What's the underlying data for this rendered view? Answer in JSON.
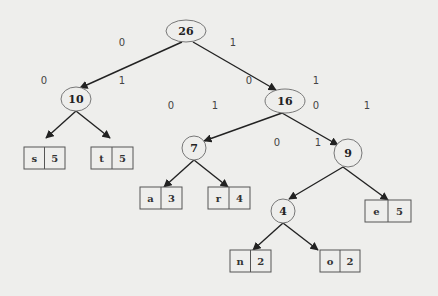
{
  "diagram": {
    "type": "huffman-tree",
    "colors": {
      "background": "#eeeeec",
      "stroke": "#222222",
      "node_outline": "#777777",
      "text": "#222222"
    },
    "internal_nodes": [
      {
        "id": "n26",
        "label": "26",
        "cx": 186,
        "cy": 31,
        "rx": 20,
        "ry": 11
      },
      {
        "id": "n10",
        "label": "10",
        "cx": 76,
        "cy": 99,
        "rx": 15,
        "ry": 12
      },
      {
        "id": "n16",
        "label": "16",
        "cx": 285,
        "cy": 101,
        "rx": 20,
        "ry": 12
      },
      {
        "id": "n7",
        "label": "7",
        "cx": 194,
        "cy": 148,
        "rx": 12,
        "ry": 12
      },
      {
        "id": "n9",
        "label": "9",
        "cx": 348,
        "cy": 153,
        "rx": 14,
        "ry": 14
      },
      {
        "id": "n4",
        "label": "4",
        "cx": 283,
        "cy": 211,
        "rx": 12,
        "ry": 12
      }
    ],
    "leaves": [
      {
        "id": "s",
        "symbol": "s",
        "weight": "5",
        "x": 24,
        "y": 147,
        "w": 41,
        "h": 22
      },
      {
        "id": "t",
        "symbol": "t",
        "weight": "5",
        "x": 91,
        "y": 147,
        "w": 42,
        "h": 22
      },
      {
        "id": "a",
        "symbol": "a",
        "weight": "3",
        "x": 140,
        "y": 187,
        "w": 42,
        "h": 22
      },
      {
        "id": "r",
        "symbol": "r",
        "weight": "4",
        "x": 208,
        "y": 187,
        "w": 42,
        "h": 22
      },
      {
        "id": "e",
        "symbol": "e",
        "weight": "5",
        "x": 365,
        "y": 200,
        "w": 46,
        "h": 22
      },
      {
        "id": "n",
        "symbol": "n",
        "weight": "2",
        "x": 230,
        "y": 250,
        "w": 41,
        "h": 22
      },
      {
        "id": "o",
        "symbol": "o",
        "weight": "2",
        "x": 320,
        "y": 250,
        "w": 40,
        "h": 22
      }
    ],
    "edges": [
      {
        "from": "n26",
        "to": "n10",
        "x1": 182,
        "y1": 42,
        "x2": 80,
        "y2": 88
      },
      {
        "from": "n26",
        "to": "n16",
        "x1": 193,
        "y1": 42,
        "x2": 276,
        "y2": 90
      },
      {
        "from": "n10",
        "to": "s",
        "x1": 76,
        "y1": 111,
        "x2": 46,
        "y2": 138
      },
      {
        "from": "n10",
        "to": "t",
        "x1": 76,
        "y1": 111,
        "x2": 110,
        "y2": 138
      },
      {
        "from": "n16",
        "to": "n7",
        "x1": 282,
        "y1": 113,
        "x2": 204,
        "y2": 141
      },
      {
        "from": "n16",
        "to": "n9",
        "x1": 282,
        "y1": 113,
        "x2": 338,
        "y2": 145
      },
      {
        "from": "n7",
        "to": "a",
        "x1": 194,
        "y1": 160,
        "x2": 164,
        "y2": 187
      },
      {
        "from": "n7",
        "to": "r",
        "x1": 194,
        "y1": 160,
        "x2": 228,
        "y2": 187
      },
      {
        "from": "n9",
        "to": "n4",
        "x1": 343,
        "y1": 167,
        "x2": 289,
        "y2": 199
      },
      {
        "from": "n9",
        "to": "e",
        "x1": 343,
        "y1": 167,
        "x2": 388,
        "y2": 200
      },
      {
        "from": "n4",
        "to": "n",
        "x1": 283,
        "y1": 223,
        "x2": 253,
        "y2": 250
      },
      {
        "from": "n4",
        "to": "o",
        "x1": 283,
        "y1": 223,
        "x2": 318,
        "y2": 250
      }
    ],
    "edge_labels": [
      {
        "text": "0",
        "x": 122,
        "y": 46
      },
      {
        "text": "1",
        "x": 233,
        "y": 46
      },
      {
        "text": "0",
        "x": 44,
        "y": 84
      },
      {
        "text": "1",
        "x": 122,
        "y": 84
      },
      {
        "text": "0",
        "x": 249,
        "y": 84
      },
      {
        "text": "1",
        "x": 316,
        "y": 84
      },
      {
        "text": "0",
        "x": 171,
        "y": 109
      },
      {
        "text": "1",
        "x": 215,
        "y": 109
      },
      {
        "text": "0",
        "x": 316,
        "y": 109
      },
      {
        "text": "1",
        "x": 367,
        "y": 109
      },
      {
        "text": "0",
        "x": 277,
        "y": 146
      },
      {
        "text": "1",
        "x": 318,
        "y": 146
      }
    ]
  }
}
